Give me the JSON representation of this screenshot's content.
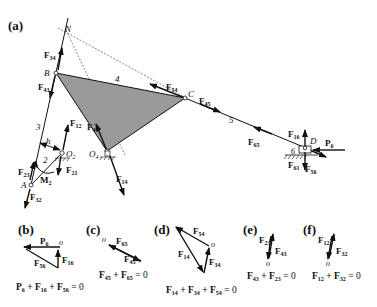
{
  "figure": {
    "panels": [
      {
        "id": "a",
        "label": "(a)"
      },
      {
        "id": "b",
        "label": "(b)"
      },
      {
        "id": "c",
        "label": "(c)"
      },
      {
        "id": "d",
        "label": "(d)"
      },
      {
        "id": "e",
        "label": "(e)"
      },
      {
        "id": "f",
        "label": "(f)"
      }
    ],
    "mechanism": {
      "points": {
        "N": "N",
        "B": "B",
        "C": "C",
        "D": "D",
        "A": "A",
        "O2": "O",
        "O2_sub": "2",
        "O4": "O",
        "O4_sub": "4",
        "h": "h",
        "M2": "M",
        "M2_sub": "2"
      },
      "links": {
        "l2": "2",
        "l3": "3",
        "l4": "4",
        "l5": "5",
        "l6": "6"
      },
      "forces": {
        "F34": {
          "F": "F",
          "sub": "34"
        },
        "F43": {
          "F": "F",
          "sub": "43"
        },
        "F54": {
          "F": "F",
          "sub": "54"
        },
        "F45": {
          "F": "F",
          "sub": "45"
        },
        "F41": {
          "F": "F",
          "sub": "41"
        },
        "F14": {
          "F": "F",
          "sub": "14"
        },
        "F12": {
          "F": "F",
          "sub": "12"
        },
        "F21": {
          "F": "F",
          "sub": "21"
        },
        "F23": {
          "F": "F",
          "sub": "23"
        },
        "F32": {
          "F": "F",
          "sub": "32"
        },
        "F16": {
          "F": "F",
          "sub": "16"
        },
        "F61": {
          "F": "F",
          "sub": "61"
        },
        "F65": {
          "F": "F",
          "sub": "65"
        },
        "F56": {
          "F": "F",
          "sub": "56"
        },
        "P6": {
          "F": "P",
          "sub": "6"
        }
      }
    },
    "polygons": {
      "b": {
        "origin": "o",
        "vectors": [
          {
            "F": "P",
            "sub": "6"
          },
          {
            "F": "F",
            "sub": "16"
          },
          {
            "F": "F",
            "sub": "56"
          }
        ],
        "equation": [
          {
            "F": "P",
            "sub": "6"
          },
          {
            "F": "F",
            "sub": "16"
          },
          {
            "F": "F",
            "sub": "56"
          }
        ],
        "rhs": " = 0"
      },
      "c": {
        "origin": "o",
        "vectors": [
          {
            "F": "F",
            "sub": "65"
          },
          {
            "F": "F",
            "sub": "45"
          }
        ],
        "equation": [
          {
            "F": "F",
            "sub": "45"
          },
          {
            "F": "F",
            "sub": "65"
          }
        ],
        "rhs": " = 0"
      },
      "d": {
        "origin": "o",
        "vectors": [
          {
            "F": "F",
            "sub": "54"
          },
          {
            "F": "F",
            "sub": "14"
          },
          {
            "F": "F",
            "sub": "34"
          }
        ],
        "equation": [
          {
            "F": "F",
            "sub": "14"
          },
          {
            "F": "F",
            "sub": "34"
          },
          {
            "F": "F",
            "sub": "54"
          }
        ],
        "rhs": " = 0"
      },
      "e": {
        "origin": "o",
        "vectors": [
          {
            "F": "F",
            "sub": "23"
          },
          {
            "F": "F",
            "sub": "43"
          }
        ],
        "equation": [
          {
            "F": "F",
            "sub": "43"
          },
          {
            "F": "F",
            "sub": "23"
          }
        ],
        "rhs": " = 0"
      },
      "f": {
        "origin": "o",
        "vectors": [
          {
            "F": "F",
            "sub": "12"
          },
          {
            "F": "F",
            "sub": "32"
          }
        ],
        "equation": [
          {
            "F": "F",
            "sub": "12"
          },
          {
            "F": "F",
            "sub": "32"
          }
        ],
        "rhs": " = 0"
      }
    },
    "colors": {
      "link4_fill": "#9a9a9a",
      "line": "#111111",
      "dashed": "#444444"
    },
    "plus": " + "
  }
}
